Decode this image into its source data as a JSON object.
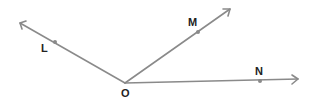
{
  "diagram": {
    "type": "geometry-rays",
    "vertex": {
      "label": "O",
      "x": 125,
      "y": 83,
      "label_x": 121,
      "label_y": 97
    },
    "rays": [
      {
        "name": "OL",
        "tip": [
          20,
          23
        ],
        "point": {
          "label": "L",
          "x": 55,
          "y": 42,
          "label_x": 41,
          "label_y": 52
        }
      },
      {
        "name": "OM",
        "tip": [
          230,
          9
        ],
        "point": {
          "label": "M",
          "x": 198,
          "y": 32,
          "label_x": 188,
          "label_y": 26
        }
      },
      {
        "name": "ON",
        "tip": [
          298,
          79
        ],
        "point": {
          "label": "N",
          "x": 260,
          "y": 81,
          "label_x": 255,
          "label_y": 75
        }
      }
    ],
    "colors": {
      "ray": "#8a8a8a",
      "label": "#222222"
    }
  }
}
